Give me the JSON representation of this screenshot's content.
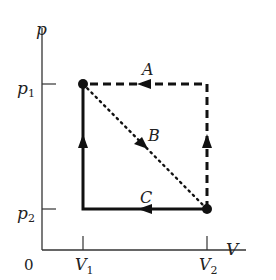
{
  "diagram": {
    "type": "pV-diagram",
    "axes": {
      "y_label": "p",
      "x_label": "V",
      "origin_label": "0",
      "y_ticks": [
        {
          "label_main": "p",
          "label_sub": "1",
          "y": 84
        },
        {
          "label_main": "p",
          "label_sub": "2",
          "y": 209
        }
      ],
      "x_ticks": [
        {
          "label_main": "V",
          "label_sub": "1",
          "x": 83
        },
        {
          "label_main": "V",
          "label_sub": "2",
          "x": 207
        }
      ]
    },
    "states": [
      {
        "name": "state-1",
        "V": "V1",
        "p": "p1"
      },
      {
        "name": "state-2",
        "V": "V2",
        "p": "p2"
      }
    ],
    "paths": [
      {
        "label": "A",
        "style": "dashed",
        "description": "State 2 up to (V2,p1), then left to state 1"
      },
      {
        "label": "B",
        "style": "dotted",
        "description": "Straight diagonal from state 1 to state 2"
      },
      {
        "label": "C",
        "style": "solid",
        "description": "State 2 left to (V1,p2), then up to state 1"
      }
    ],
    "colors": {
      "ink": "#111111",
      "axis": "#333333",
      "background": "#ffffff"
    }
  }
}
